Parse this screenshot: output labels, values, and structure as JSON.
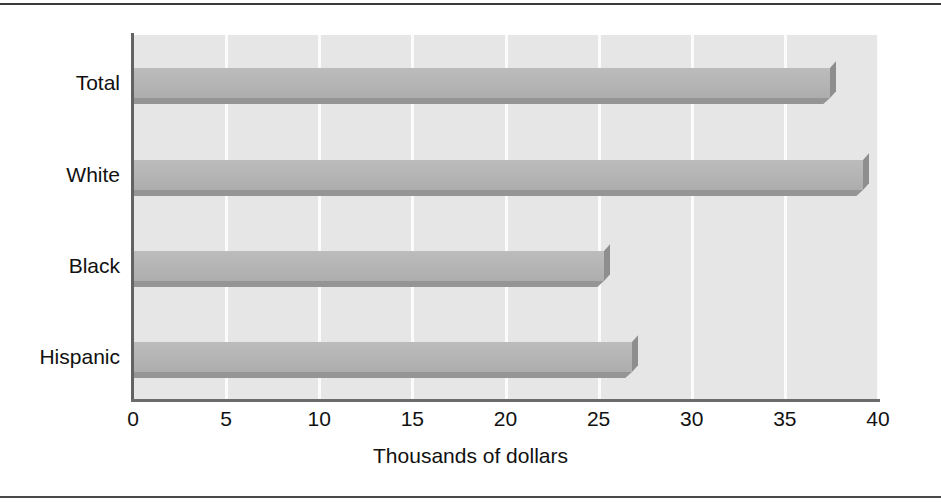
{
  "chart_data": {
    "type": "bar",
    "orientation": "horizontal",
    "title": "",
    "xlabel": "Thousands of dollars",
    "ylabel": "",
    "categories": [
      "Total",
      "White",
      "Black",
      "Hispanic"
    ],
    "values": [
      37.4,
      39.2,
      25.3,
      26.8
    ],
    "xlim": [
      0,
      40
    ],
    "xticks": [
      0,
      5,
      10,
      15,
      20,
      25,
      30,
      35,
      40
    ],
    "xticklabels": [
      "0",
      "5",
      "10",
      "15",
      "20",
      "25",
      "30",
      "35",
      "40"
    ],
    "grid": "vertical-only",
    "legend": "none",
    "series": [
      {
        "name": "Median income",
        "values": [
          37.4,
          39.2,
          25.3,
          26.8
        ]
      }
    ]
  },
  "style": {
    "plot_background": "#e6e6e6",
    "bar_color": "#b4b4b4",
    "bar_shadow_color": "#8e8e8e",
    "gridline_color": "#fbfbfb",
    "axis_color": "#6b6b6b",
    "text_color": "#111111",
    "frame_rule_color": "#3a3a3a"
  }
}
